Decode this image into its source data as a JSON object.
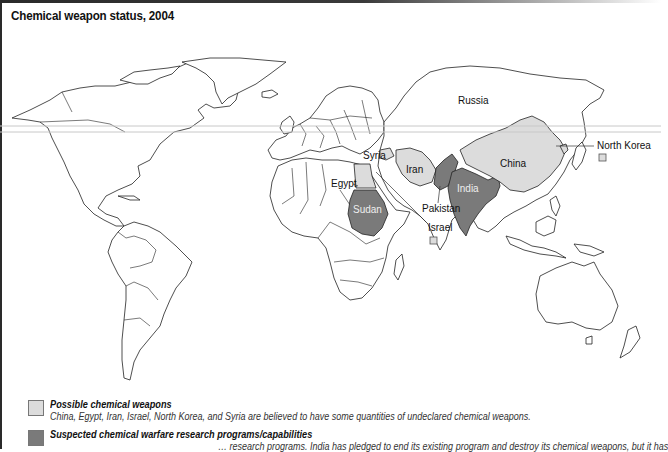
{
  "title": "Chemical weapon status, 2004",
  "colors": {
    "possible": "#dcdcdc",
    "suspected": "#7a7a7a",
    "outline": "#222222"
  },
  "map": {
    "labels": {
      "russia": "Russia",
      "china": "China",
      "north_korea": "North Korea",
      "syria": "Syria",
      "iran": "Iran",
      "egypt": "Egypt",
      "india": "India",
      "pakistan": "Pakistan",
      "sudan": "Sudan",
      "israel": "Israel"
    },
    "possible_countries": [
      "China",
      "Egypt",
      "Iran",
      "Israel",
      "North Korea",
      "Syria"
    ],
    "suspected_countries": [
      "India",
      "Pakistan",
      "Sudan"
    ]
  },
  "legend": {
    "items": [
      {
        "title": "Possible chemical weapons",
        "description": "China, Egypt, Iran, Israel, North Korea, and Syria are believed to have some quantities of undeclared chemical weapons."
      },
      {
        "title": "Suspected chemical warfare research programs/capabilities",
        "description": "… research programs. India has pledged to end its existing program and destroy its chemical weapons, but it has"
      }
    ]
  }
}
